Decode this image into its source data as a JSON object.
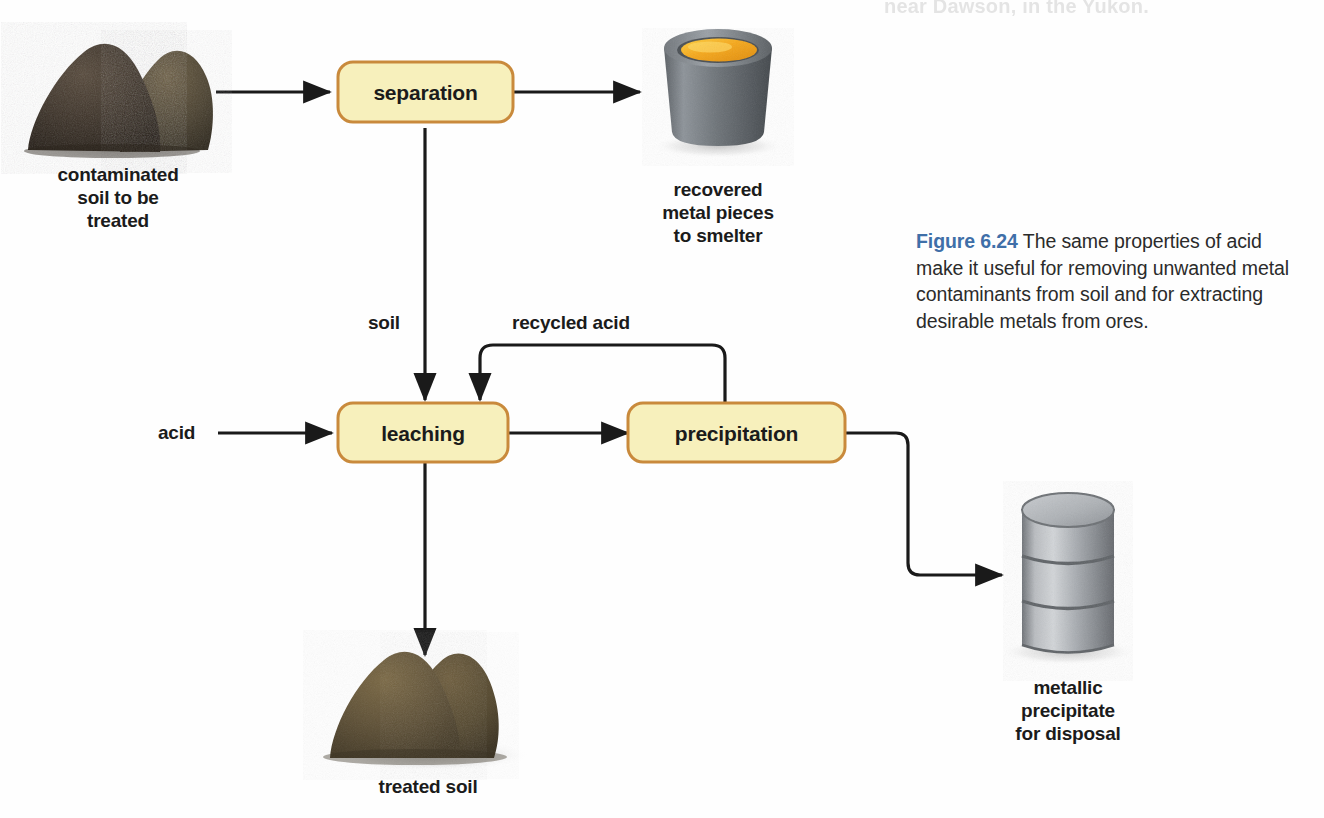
{
  "page": {
    "background_bleed_top": "near Dawson, in the Yukon."
  },
  "diagram": {
    "type": "process-flowchart",
    "box_fill": "#f7f0bc",
    "box_border": "#c98a3c",
    "line_color": "#1a1a1a",
    "processes": [
      {
        "id": "separation",
        "label": "separation"
      },
      {
        "id": "leaching",
        "label": "leaching"
      },
      {
        "id": "precipitation",
        "label": "precipitation"
      }
    ],
    "edge_labels": [
      {
        "id": "soil",
        "label": "soil"
      },
      {
        "id": "recycled-acid",
        "label": "recycled acid"
      },
      {
        "id": "acid",
        "label": "acid"
      }
    ],
    "objects": [
      {
        "id": "contaminated-soil",
        "label": "contaminated\nsoil to be\ntreated"
      },
      {
        "id": "recovered-metal",
        "label": "recovered\nmetal pieces\nto smelter"
      },
      {
        "id": "treated-soil",
        "label": "treated soil"
      },
      {
        "id": "metallic-precipitate",
        "label": "metallic\nprecipitate\nfor disposal"
      }
    ],
    "connections": [
      {
        "from": "contaminated-soil",
        "to": "separation"
      },
      {
        "from": "separation",
        "to": "recovered-metal"
      },
      {
        "from": "separation",
        "to": "leaching",
        "label": "soil"
      },
      {
        "from": "acid",
        "to": "leaching"
      },
      {
        "from": "leaching",
        "to": "precipitation"
      },
      {
        "from": "leaching",
        "to": "treated-soil"
      },
      {
        "from": "precipitation",
        "to": "leaching",
        "label": "recycled acid"
      },
      {
        "from": "precipitation",
        "to": "metallic-precipitate"
      }
    ]
  },
  "caption": {
    "figure_number": "Figure 6.24",
    "text": "The same properties of acid make it useful for removing unwanted metal contaminants from soil and for extracting desirable metals from ores.",
    "number_color": "#3f6fa8"
  }
}
